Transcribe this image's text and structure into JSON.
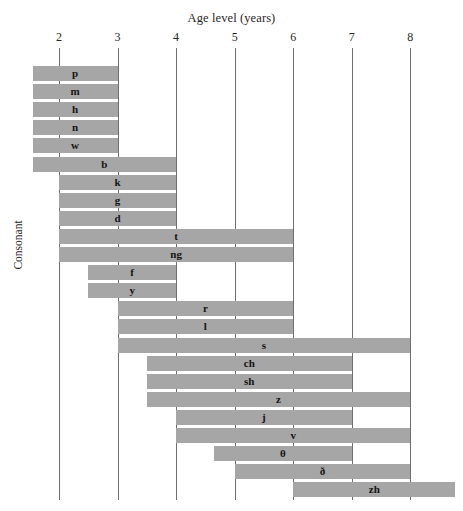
{
  "chart_data": {
    "type": "bar",
    "orientation": "horizontal",
    "title": "Age level (years)",
    "xlabel": "Age level (years)",
    "ylabel": "Consonant",
    "xlim": [
      1.55,
      8.77
    ],
    "grid": true,
    "legend": false,
    "xticks": [
      2,
      3,
      4,
      5,
      6,
      7,
      8
    ],
    "xtick_labels": [
      "2",
      "3",
      "4",
      "5",
      "6",
      "7",
      "8"
    ],
    "categories": [
      "p",
      "m",
      "h",
      "n",
      "w",
      "b",
      "k",
      "g",
      "d",
      "t",
      "ng",
      "f",
      "y",
      "r",
      "l",
      "s",
      "ch",
      "sh",
      "z",
      "j",
      "v",
      "θ",
      "ð",
      "zh"
    ],
    "bars": [
      {
        "label": "p",
        "start": 1.55,
        "end": 3.0
      },
      {
        "label": "m",
        "start": 1.55,
        "end": 3.0
      },
      {
        "label": "h",
        "start": 1.55,
        "end": 3.0
      },
      {
        "label": "n",
        "start": 1.55,
        "end": 3.0
      },
      {
        "label": "w",
        "start": 1.55,
        "end": 3.0
      },
      {
        "label": "b",
        "start": 1.55,
        "end": 4.0
      },
      {
        "label": "k",
        "start": 2.0,
        "end": 4.0
      },
      {
        "label": "g",
        "start": 2.0,
        "end": 4.0
      },
      {
        "label": "d",
        "start": 2.0,
        "end": 4.0
      },
      {
        "label": "t",
        "start": 2.0,
        "end": 6.0
      },
      {
        "label": "ng",
        "start": 2.0,
        "end": 6.0
      },
      {
        "label": "f",
        "start": 2.5,
        "end": 4.0
      },
      {
        "label": "y",
        "start": 2.5,
        "end": 4.0
      },
      {
        "label": "r",
        "start": 3.0,
        "end": 6.0
      },
      {
        "label": "l",
        "start": 3.0,
        "end": 6.0
      },
      {
        "label": "s",
        "start": 3.0,
        "end": 8.0
      },
      {
        "label": "ch",
        "start": 3.5,
        "end": 7.0
      },
      {
        "label": "sh",
        "start": 3.5,
        "end": 7.0
      },
      {
        "label": "z",
        "start": 3.5,
        "end": 8.0
      },
      {
        "label": "j",
        "start": 4.0,
        "end": 7.0
      },
      {
        "label": "v",
        "start": 4.0,
        "end": 8.0
      },
      {
        "label": "θ",
        "start": 4.65,
        "end": 7.0
      },
      {
        "label": "ð",
        "start": 5.0,
        "end": 8.0
      },
      {
        "label": "zh",
        "start": 6.0,
        "end": 8.77
      }
    ]
  }
}
